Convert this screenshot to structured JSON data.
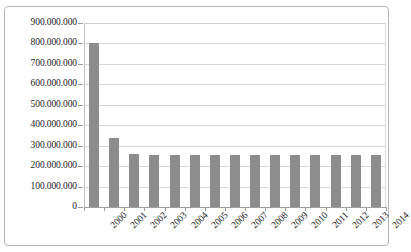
{
  "chart_data": {
    "type": "bar",
    "title": "",
    "subtitle": "",
    "xlabel": "",
    "ylabel": "",
    "categories": [
      "2000",
      "2001",
      "2002",
      "2003",
      "2004",
      "2005",
      "2006",
      "2007",
      "2008",
      "2009",
      "2010",
      "2011",
      "2012",
      "2013",
      "2014"
    ],
    "values": [
      800000000,
      340000000,
      260000000,
      255000000,
      255000000,
      255000000,
      255000000,
      255000000,
      255000000,
      255000000,
      255000000,
      255000000,
      255000000,
      255000000,
      255000000
    ],
    "series": [
      {
        "name": "",
        "values": [
          800000000,
          340000000,
          260000000,
          255000000,
          255000000,
          255000000,
          255000000,
          255000000,
          255000000,
          255000000,
          255000000,
          255000000,
          255000000,
          255000000,
          255000000
        ]
      }
    ],
    "ylim": [
      0,
      900000000
    ],
    "ytick_values": [
      0,
      100000000,
      200000000,
      300000000,
      400000000,
      500000000,
      600000000,
      700000000,
      800000000,
      900000000
    ],
    "ytick_labels": [
      "0",
      "100.000.000",
      "200.000.000",
      "300.000.000",
      "400.000.000",
      "500.000.000",
      "600.000.000",
      "700.000.000",
      "800.000.000",
      "900.000.000"
    ],
    "grid": true,
    "legend": false,
    "legend_position": "none",
    "bar_color": "#8c8c8c",
    "gridline_color": "#d9d9d9",
    "axis_color": "#a0a0a0",
    "background_color": "#ffffff",
    "border_color": "#b5b5b5",
    "xtick_label_rotation": -45
  }
}
